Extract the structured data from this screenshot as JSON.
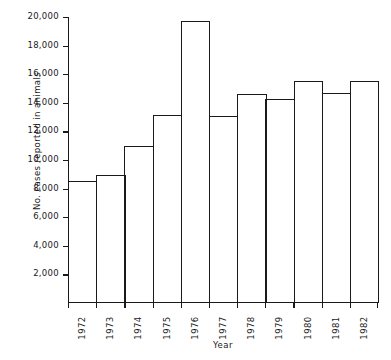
{
  "chart_data": {
    "type": "bar",
    "title": "",
    "xlabel": "Year",
    "ylabel": "No. cases reported in animals",
    "categories": [
      "1972",
      "1973",
      "1974",
      "1975",
      "1976",
      "1977",
      "1978",
      "1979",
      "1980",
      "1981",
      "1982"
    ],
    "values": [
      8500,
      8950,
      11000,
      13150,
      19750,
      13100,
      14600,
      14300,
      15500,
      14700,
      15500
    ],
    "ylim": [
      0,
      20000
    ],
    "yticks": [
      2000,
      4000,
      6000,
      8000,
      10000,
      12000,
      14000,
      16000,
      18000,
      20000
    ],
    "ytick_labels": [
      "2,000",
      "4,000",
      "6,000",
      "8,000",
      "10,000",
      "12,000",
      "14,000",
      "16,000",
      "18,000",
      "20,000"
    ],
    "grid": false,
    "legend": false,
    "bar_style": "outline-only, contiguous bars, black 1px stroke, white fill"
  }
}
